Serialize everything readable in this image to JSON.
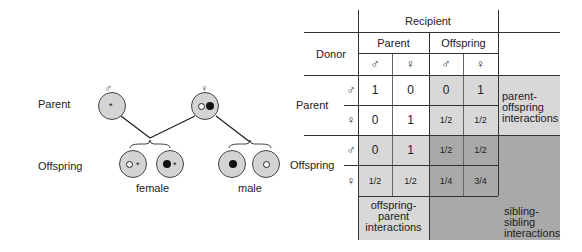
{
  "diagram": {
    "row_labels": {
      "parent": "Parent",
      "offspring": "Offspring"
    },
    "parents": [
      {
        "sex_symbol": "♂",
        "markers": [
          "star"
        ]
      },
      {
        "sex_symbol": "♀",
        "markers": [
          "open-circle",
          "filled-circle"
        ]
      }
    ],
    "offspring_groups": [
      {
        "label": "female",
        "individuals": [
          [
            "open-circle",
            "star"
          ],
          [
            "filled-circle",
            "star"
          ]
        ]
      },
      {
        "label": "male",
        "individuals": [
          [
            "filled-circle"
          ],
          [
            "open-circle"
          ]
        ]
      }
    ],
    "star_glyph": "*"
  },
  "table": {
    "recipient_label": "Recipient",
    "donor_label": "Donor",
    "recipient_groups": [
      "Parent",
      "Offspring"
    ],
    "recipient_sexes": [
      "♂",
      "♀",
      "♂",
      "♀"
    ],
    "rows": [
      {
        "group": "Parent",
        "sex": "♂",
        "values": [
          "1",
          "0",
          "0",
          "1"
        ]
      },
      {
        "group": "Parent",
        "sex": "♀",
        "values": [
          "0",
          "1",
          "1/2",
          "1/2"
        ]
      },
      {
        "group": "Offspring",
        "sex": "♂",
        "values": [
          "0",
          "1",
          "1/2",
          "1/2"
        ]
      },
      {
        "group": "Offspring",
        "sex": "♀",
        "values": [
          "1/2",
          "1/2",
          "1/4",
          "3/4"
        ]
      }
    ],
    "annotations": {
      "parent_offspring": "parent-\noffspring\ninteractions",
      "offspring_parent": "offspring-\nparent\ninteractions",
      "sibling_sibling": "sibling-\nsibling\ninteractions"
    },
    "colors": {
      "light": "#d8d8d8",
      "dark": "#a9a9a9",
      "white": "#ffffff"
    }
  }
}
